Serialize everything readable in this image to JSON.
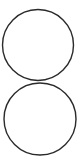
{
  "diagram": {
    "background": "#ffffff",
    "stroke_color": "#2a2a2a",
    "stroke_width": 1.4,
    "shapes": [
      {
        "id": "top-circle",
        "type": "circle",
        "cx": 38,
        "cy": 45,
        "r": 35.5
      },
      {
        "id": "bottom-circle",
        "type": "circle",
        "cx": 40,
        "cy": 119,
        "r": 36
      }
    ]
  }
}
